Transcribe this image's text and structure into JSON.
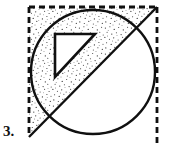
{
  "figure": {
    "item_label": "3.",
    "canvas": {
      "width": 170,
      "height": 153
    },
    "colors": {
      "stroke": "#101010",
      "background": "#ffffff",
      "stipple_dot": "#2b2b2b",
      "label": "#101010"
    },
    "shapes": {
      "square": {
        "name": "dashed-square",
        "left": 29,
        "top": 7,
        "right": 157,
        "bottom": 145,
        "stroke_style": "dashed",
        "dash_pattern": "6 4",
        "stroke_width": 2.6,
        "sides_drawn": [
          "left",
          "top",
          "right"
        ]
      },
      "circle": {
        "name": "inscribed-circle",
        "cx": 93,
        "cy": 72,
        "r": 62,
        "stroke_style": "solid",
        "stroke_width": 2.4
      },
      "diagonal": {
        "name": "diagonal-line",
        "x1": 157,
        "y1": 7,
        "x2": 29,
        "y2": 137,
        "stroke_style": "solid",
        "stroke_width": 2.4
      },
      "inner_triangle": {
        "name": "inner-triangle",
        "points": "55,34 95,34 55,77",
        "stroke_style": "solid",
        "stroke_width": 2.6,
        "fill": "none"
      }
    },
    "shading": {
      "name": "stipple-region",
      "pattern": "stipple-dots",
      "description": "region above and left of the diagonal, clipped to square and circle union, excluding the inner triangle",
      "density": "fine"
    }
  }
}
